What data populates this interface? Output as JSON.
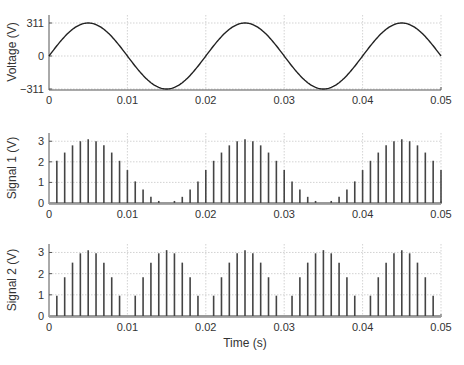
{
  "chart_data": [
    {
      "type": "line",
      "title": "",
      "xlabel": "",
      "ylabel": "Voltage (V)",
      "xlim": [
        0,
        0.05
      ],
      "ylim": [
        -311,
        311
      ],
      "xticks": [
        "0",
        "0.01",
        "0.02",
        "0.03",
        "0.04",
        "0.05"
      ],
      "yticks": [
        "311",
        "0",
        "−311"
      ],
      "grid": true,
      "series": [
        {
          "name": "Voltage",
          "function": "311*sin(2*pi*50*t)",
          "amplitude": 311,
          "frequency_hz": 50
        }
      ]
    },
    {
      "type": "bar",
      "title": "",
      "xlabel": "",
      "ylabel": "Signal 1 (V)",
      "xlim": [
        0,
        0.05
      ],
      "ylim": [
        0,
        3.4
      ],
      "xticks": [
        "0",
        "0.01",
        "0.02",
        "0.03",
        "0.04",
        "0.05"
      ],
      "yticks": [
        "0",
        "1",
        "2",
        "3"
      ],
      "grid": true,
      "x": [
        0.001,
        0.002,
        0.003,
        0.004,
        0.005,
        0.006,
        0.007,
        0.008,
        0.009,
        0.01,
        0.011,
        0.012,
        0.013,
        0.014,
        0.015,
        0.016,
        0.017,
        0.018,
        0.019,
        0.02,
        0.021,
        0.022,
        0.023,
        0.024,
        0.025,
        0.026,
        0.027,
        0.028,
        0.029,
        0.03,
        0.031,
        0.032,
        0.033,
        0.034,
        0.035,
        0.036,
        0.037,
        0.038,
        0.039,
        0.04,
        0.041,
        0.042,
        0.043,
        0.044,
        0.045,
        0.046,
        0.047,
        0.048,
        0.049,
        0.05
      ],
      "values": [
        2.05,
        2.45,
        2.8,
        3.0,
        3.1,
        3.0,
        2.8,
        2.45,
        2.05,
        1.6,
        1.05,
        0.65,
        0.3,
        0.1,
        0.0,
        0.1,
        0.3,
        0.65,
        1.05,
        1.6,
        2.05,
        2.45,
        2.8,
        3.0,
        3.1,
        3.0,
        2.8,
        2.45,
        2.05,
        1.6,
        1.05,
        0.65,
        0.3,
        0.1,
        0.0,
        0.1,
        0.3,
        0.65,
        1.05,
        1.6,
        2.05,
        2.45,
        2.8,
        3.0,
        3.1,
        3.0,
        2.8,
        2.45,
        2.05,
        1.6
      ]
    },
    {
      "type": "bar",
      "title": "",
      "xlabel": "Time (s)",
      "ylabel": "Signal 2 (V)",
      "xlim": [
        0,
        0.05
      ],
      "ylim": [
        0,
        3.4
      ],
      "xticks": [
        "0",
        "0.01",
        "0.02",
        "0.03",
        "0.04",
        "0.05"
      ],
      "yticks": [
        "0",
        "1",
        "2",
        "3"
      ],
      "grid": true,
      "x": [
        0.001,
        0.002,
        0.003,
        0.004,
        0.005,
        0.006,
        0.007,
        0.008,
        0.009,
        0.01,
        0.011,
        0.012,
        0.013,
        0.014,
        0.015,
        0.016,
        0.017,
        0.018,
        0.019,
        0.02,
        0.021,
        0.022,
        0.023,
        0.024,
        0.025,
        0.026,
        0.027,
        0.028,
        0.029,
        0.03,
        0.031,
        0.032,
        0.033,
        0.034,
        0.035,
        0.036,
        0.037,
        0.038,
        0.039,
        0.04,
        0.041,
        0.042,
        0.043,
        0.044,
        0.045,
        0.046,
        0.047,
        0.048,
        0.049,
        0.05
      ],
      "values": [
        0.96,
        1.83,
        2.52,
        2.96,
        3.11,
        2.96,
        2.52,
        1.83,
        0.96,
        0.0,
        0.96,
        1.83,
        2.52,
        2.96,
        3.11,
        2.96,
        2.52,
        1.83,
        0.96,
        0.0,
        0.96,
        1.83,
        2.52,
        2.96,
        3.11,
        2.96,
        2.52,
        1.83,
        0.96,
        0.0,
        0.96,
        1.83,
        2.52,
        2.96,
        3.11,
        2.96,
        2.52,
        1.83,
        0.96,
        0.0,
        0.96,
        1.83,
        2.52,
        2.96,
        3.11,
        2.96,
        2.52,
        1.83,
        0.96,
        0.0
      ]
    }
  ],
  "layout": {
    "line_color": "#222222",
    "bar_color": "#444444",
    "baseline_color": "#999999"
  }
}
